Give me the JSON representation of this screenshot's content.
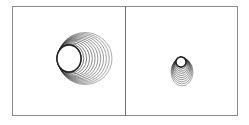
{
  "figure": {
    "panels": [
      {
        "id": "left",
        "description": "Concentric rings expanding to the right (tube-like)",
        "ring_count": 12,
        "inner": {
          "cx": 69,
          "cy": 58.5,
          "rx": 12,
          "ry": 13.5
        },
        "outer": {
          "cx": 85,
          "cy": 58.5,
          "rx": 27,
          "ry": 26
        },
        "stroke_color": "#222222"
      },
      {
        "id": "right",
        "description": "Small stacked ellipses narrowing upward",
        "ring_count": 10,
        "inner": {
          "cx": 181,
          "cy": 62,
          "rx": 5,
          "ry": 5
        },
        "outer": {
          "cx": 182,
          "cy": 72,
          "rx": 11,
          "ry": 14
        },
        "stroke_color": "#222222"
      }
    ],
    "colors": {
      "border": "#8a8a8a",
      "divider": "#6f6f6f",
      "background": "#ffffff"
    }
  }
}
